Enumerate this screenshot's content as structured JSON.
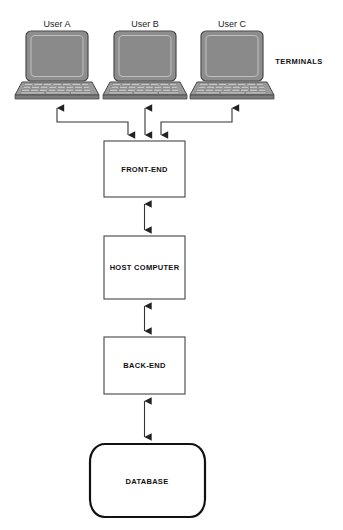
{
  "diagram": {
    "group_label": "TERMINALS",
    "terminals": [
      {
        "id": "user-a",
        "label": "User A",
        "icon": "laptop-icon",
        "cx": 57,
        "cy": 62
      },
      {
        "id": "user-b",
        "label": "User B",
        "icon": "laptop-icon",
        "cx": 145,
        "cy": 62
      },
      {
        "id": "user-c",
        "label": "User C",
        "icon": "laptop-icon",
        "cx": 232,
        "cy": 62
      }
    ],
    "nodes": [
      {
        "id": "front-end",
        "label": "FRONT-END",
        "shape": "rect",
        "x": 104,
        "y": 141,
        "w": 81,
        "h": 56
      },
      {
        "id": "host-computer",
        "label": "HOST COMPUTER",
        "shape": "rect",
        "x": 104,
        "y": 236,
        "w": 81,
        "h": 63
      },
      {
        "id": "back-end",
        "label": "BACK-END",
        "shape": "rect",
        "x": 104,
        "y": 337,
        "w": 81,
        "h": 57
      },
      {
        "id": "database",
        "label": "DATABASE",
        "shape": "rounded-barrel",
        "x": 90,
        "y": 443,
        "w": 115,
        "h": 75
      }
    ],
    "connections": [
      {
        "id": "user-a-to-front-end",
        "from": "user-a",
        "to": "front-end",
        "arrows": "both",
        "routing": "elbow"
      },
      {
        "id": "user-b-to-front-end",
        "from": "user-b",
        "to": "front-end",
        "arrows": "both",
        "routing": "straight"
      },
      {
        "id": "user-c-to-front-end",
        "from": "user-c",
        "to": "front-end",
        "arrows": "both",
        "routing": "elbow"
      },
      {
        "id": "front-end-to-host",
        "from": "front-end",
        "to": "host-computer",
        "arrows": "both",
        "routing": "straight"
      },
      {
        "id": "host-to-back-end",
        "from": "host-computer",
        "to": "back-end",
        "arrows": "both",
        "routing": "straight"
      },
      {
        "id": "back-end-to-database",
        "from": "back-end",
        "to": "database",
        "arrows": "both",
        "routing": "straight"
      }
    ],
    "colors": {
      "background": "#ffffff",
      "line": "#333333",
      "box_stroke": "#444444",
      "box_fill": "#ffffff",
      "database_stroke": "#111111",
      "screen_fill": "#8a8a8a",
      "base_fill": "#9a9a9a",
      "key_fill": "#c4c4c4",
      "text": "#111111"
    }
  }
}
